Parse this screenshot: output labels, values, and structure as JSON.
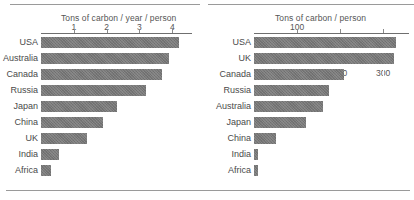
{
  "chart_data": [
    {
      "type": "bar",
      "orientation": "horizontal",
      "title": "Tons of carbon / year / person",
      "xlabel": "Tons of carbon / year / person",
      "ylabel": "",
      "categories": [
        "USA",
        "Australia",
        "Canada",
        "Russia",
        "Japan",
        "China",
        "UK",
        "India",
        "Africa"
      ],
      "values": [
        4.2,
        3.9,
        3.7,
        3.2,
        2.3,
        1.9,
        1.4,
        0.55,
        0.3
      ],
      "tick_labels": [
        "1",
        "2",
        "3",
        "4"
      ],
      "tick_values": [
        1,
        2,
        3,
        4
      ],
      "xlim": [
        0,
        4.6
      ],
      "grid": true,
      "legend": "none"
    },
    {
      "type": "bar",
      "orientation": "horizontal",
      "title": "Tons of carbon / person",
      "xlabel": "Tons of carbon / person",
      "ylabel": "",
      "categories": [
        "USA",
        "UK",
        "Canada",
        "Russia",
        "Australia",
        "Japan",
        "China",
        "India",
        "Africa"
      ],
      "values": [
        330,
        325,
        210,
        175,
        160,
        120,
        50,
        10,
        9
      ],
      "tick_labels": [
        "100",
        "200",
        "300"
      ],
      "tick_values": [
        100,
        200,
        300
      ],
      "xlim": [
        0,
        360
      ],
      "grid": true,
      "legend": "none"
    }
  ],
  "left_panel": {
    "title": "Tons of carbon / year / person",
    "ticks": [
      {
        "label": "1",
        "value": 1
      },
      {
        "label": "2",
        "value": 2
      },
      {
        "label": "3",
        "value": 3
      },
      {
        "label": "4",
        "value": 4
      }
    ],
    "rows": [
      {
        "label": "USA",
        "value": 4.2
      },
      {
        "label": "Australia",
        "value": 3.9
      },
      {
        "label": "Canada",
        "value": 3.7
      },
      {
        "label": "Russia",
        "value": 3.2
      },
      {
        "label": "Japan",
        "value": 2.3
      },
      {
        "label": "China",
        "value": 1.9
      },
      {
        "label": "UK",
        "value": 1.4
      },
      {
        "label": "India",
        "value": 0.55
      },
      {
        "label": "Africa",
        "value": 0.3
      }
    ]
  },
  "right_panel": {
    "title": "Tons of carbon / person",
    "ticks": [
      {
        "label": "100",
        "value": 100
      },
      {
        "label": "200",
        "value": 200
      },
      {
        "label": "300",
        "value": 300
      }
    ],
    "rows": [
      {
        "label": "USA",
        "value": 330
      },
      {
        "label": "UK",
        "value": 325
      },
      {
        "label": "Canada",
        "value": 210
      },
      {
        "label": "Russia",
        "value": 175
      },
      {
        "label": "Australia",
        "value": 160
      },
      {
        "label": "Japan",
        "value": 120
      },
      {
        "label": "China",
        "value": 50
      },
      {
        "label": "India",
        "value": 10
      },
      {
        "label": "Africa",
        "value": 9
      }
    ]
  },
  "style": {
    "bar_color": "#777777",
    "rule_color": "#9a9a9a",
    "text_color": "#4a4a4a",
    "background": "#ffffff"
  }
}
